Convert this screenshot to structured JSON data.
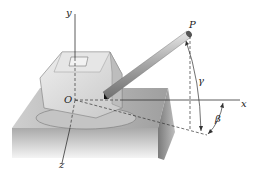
{
  "diagram": {
    "labels": {
      "y_axis": "y",
      "x_axis": "x",
      "z_axis": "z",
      "origin": "O",
      "point": "P",
      "angle_gamma": "γ",
      "angle_beta": "β"
    },
    "colors": {
      "platform_top": "#b5b5b5",
      "platform_front": "#d8d8d8",
      "platform_side": "#8a8a8a",
      "body": "#dcdcdc",
      "barrel": "#a8a8a8",
      "line": "#333333"
    }
  }
}
